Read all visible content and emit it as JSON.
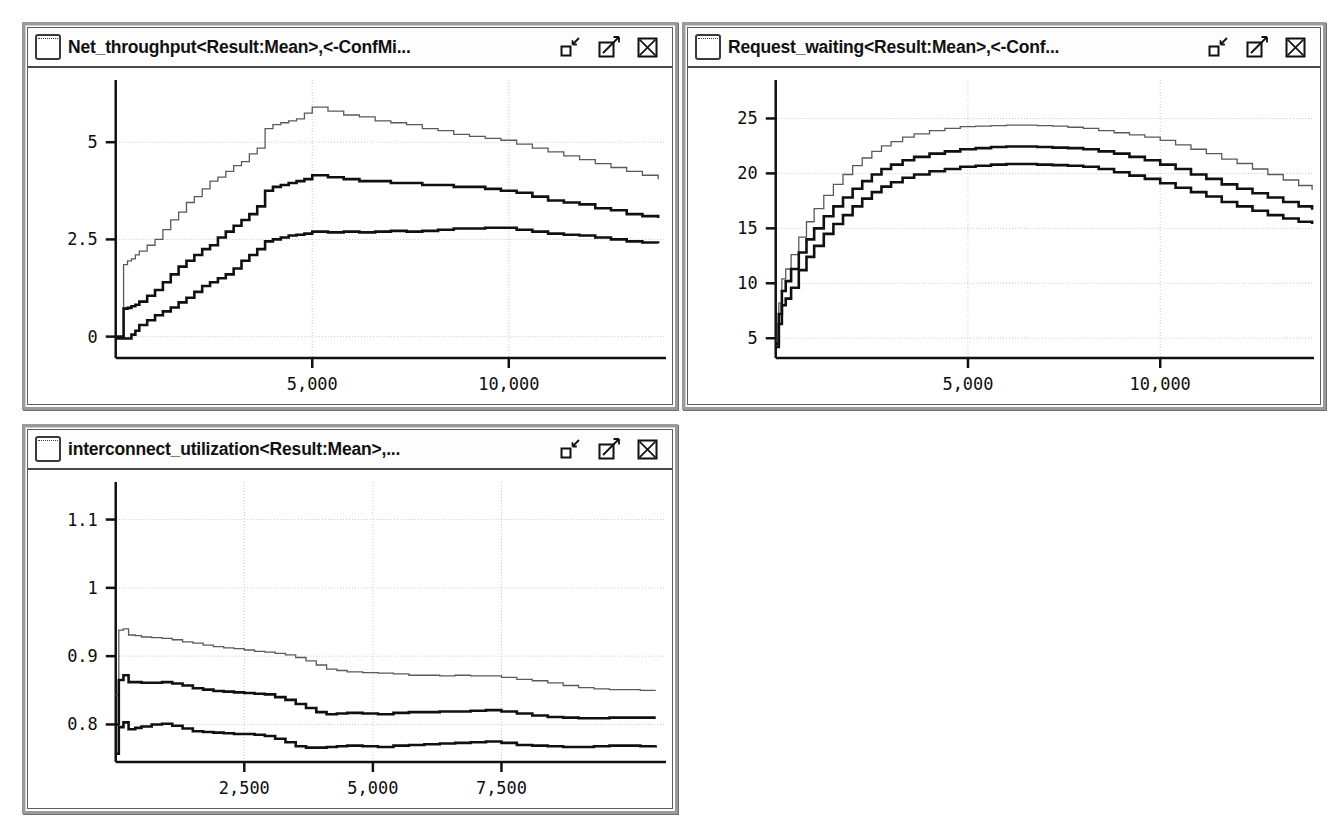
{
  "desktop": {
    "background": "#ffffff"
  },
  "icons": {
    "window": "window-icon",
    "minimize": "minimize-icon",
    "maximize": "maximize-icon",
    "close": "close-icon"
  },
  "windows": [
    {
      "id": "net-throughput",
      "title": "Net_throughput<Result:Mean>,<-ConfMi...",
      "rect": {
        "x": 22,
        "y": 22,
        "w": 656,
        "h": 388
      }
    },
    {
      "id": "request-waiting",
      "title": "Request_waiting<Result:Mean>,<-Conf...",
      "rect": {
        "x": 682,
        "y": 22,
        "w": 644,
        "h": 388
      }
    },
    {
      "id": "interconnect-utilization",
      "title": "interconnect_utilization<Result:Mean>,...",
      "rect": {
        "x": 22,
        "y": 424,
        "w": 656,
        "h": 390
      }
    }
  ],
  "chart_data": [
    {
      "id": "net-throughput",
      "type": "line",
      "title": "Net_throughput<Result:Mean>,<-ConfMi...",
      "xlabel": "",
      "ylabel": "",
      "grid": true,
      "legend": "none",
      "xlim": [
        0,
        14000
      ],
      "ylim": [
        -0.55,
        6.6
      ],
      "xticks": [
        5000,
        10000
      ],
      "xticklabels": [
        "5,000",
        "10,000"
      ],
      "yticks": [
        0,
        2.5,
        5
      ],
      "yticklabels": [
        "0",
        "2.5",
        "5"
      ],
      "x": [
        0,
        150,
        200,
        300,
        400,
        500,
        600,
        800,
        1000,
        1200,
        1400,
        1600,
        1800,
        2000,
        2200,
        2400,
        2600,
        2800,
        3000,
        3200,
        3400,
        3600,
        3800,
        4000,
        4200,
        4400,
        4600,
        4800,
        5000,
        5400,
        5800,
        6200,
        6600,
        7000,
        7400,
        7800,
        8200,
        8600,
        9000,
        9400,
        9800,
        10200,
        10600,
        11000,
        11400,
        11800,
        12200,
        12600,
        13000,
        13400,
        13800
      ],
      "series": [
        {
          "name": "ConfMax",
          "style": "thin-gray",
          "values": [
            0.0,
            0.0,
            1.85,
            1.95,
            2.0,
            2.1,
            2.2,
            2.35,
            2.5,
            2.75,
            3.0,
            3.2,
            3.45,
            3.6,
            3.8,
            4.0,
            4.1,
            4.25,
            4.4,
            4.5,
            4.7,
            4.85,
            5.35,
            5.45,
            5.5,
            5.55,
            5.6,
            5.75,
            5.9,
            5.8,
            5.7,
            5.65,
            5.55,
            5.5,
            5.45,
            5.35,
            5.3,
            5.2,
            5.15,
            5.1,
            5.05,
            4.95,
            4.85,
            4.75,
            4.65,
            4.55,
            4.45,
            4.35,
            4.25,
            4.15,
            4.05
          ]
        },
        {
          "name": "Mean",
          "style": "thick-black",
          "values": [
            0.0,
            0.0,
            0.72,
            0.74,
            0.78,
            0.82,
            0.9,
            1.05,
            1.2,
            1.4,
            1.6,
            1.8,
            1.95,
            2.1,
            2.25,
            2.35,
            2.55,
            2.7,
            2.85,
            3.0,
            3.15,
            3.35,
            3.75,
            3.85,
            3.9,
            3.95,
            4.0,
            4.05,
            4.15,
            4.1,
            4.05,
            4.0,
            4.0,
            3.95,
            3.95,
            3.9,
            3.9,
            3.85,
            3.85,
            3.8,
            3.75,
            3.7,
            3.6,
            3.5,
            3.45,
            3.4,
            3.3,
            3.25,
            3.15,
            3.1,
            3.05
          ]
        },
        {
          "name": "ConfMin",
          "style": "thick-black",
          "values": [
            -0.05,
            -0.05,
            -0.05,
            -0.05,
            0.05,
            0.15,
            0.3,
            0.42,
            0.55,
            0.65,
            0.75,
            0.88,
            1.0,
            1.15,
            1.3,
            1.4,
            1.5,
            1.6,
            1.75,
            1.95,
            2.1,
            2.25,
            2.45,
            2.5,
            2.55,
            2.6,
            2.62,
            2.65,
            2.7,
            2.68,
            2.7,
            2.68,
            2.7,
            2.72,
            2.7,
            2.72,
            2.75,
            2.78,
            2.78,
            2.8,
            2.8,
            2.75,
            2.7,
            2.65,
            2.62,
            2.6,
            2.55,
            2.5,
            2.45,
            2.42,
            2.4
          ]
        }
      ]
    },
    {
      "id": "request-waiting",
      "type": "line",
      "title": "Request_waiting<Result:Mean>,<-Conf...",
      "xlabel": "",
      "ylabel": "",
      "grid": true,
      "legend": "none",
      "xlim": [
        0,
        14000
      ],
      "ylim": [
        3.2,
        28.5
      ],
      "xticks": [
        5000,
        10000
      ],
      "xticklabels": [
        "5,000",
        "10,000"
      ],
      "yticks": [
        5,
        10,
        15,
        20,
        25
      ],
      "yticklabels": [
        "5",
        "10",
        "15",
        "20",
        "25"
      ],
      "x": [
        0,
        80,
        160,
        260,
        400,
        600,
        800,
        1000,
        1250,
        1500,
        1750,
        2000,
        2250,
        2500,
        2750,
        3000,
        3300,
        3600,
        4000,
        4400,
        4800,
        5200,
        5600,
        6000,
        6400,
        6800,
        7200,
        7600,
        8000,
        8400,
        8800,
        9200,
        9600,
        10000,
        10400,
        10800,
        11200,
        11600,
        12000,
        12400,
        12800,
        13200,
        13600,
        13950
      ],
      "series": [
        {
          "name": "ConfMax",
          "style": "thin-gray",
          "values": [
            4.8,
            8.2,
            10.4,
            11.3,
            12.6,
            14.2,
            15.6,
            16.8,
            18.0,
            19.0,
            19.9,
            20.7,
            21.4,
            22.0,
            22.5,
            22.9,
            23.3,
            23.6,
            23.9,
            24.1,
            24.25,
            24.3,
            24.35,
            24.4,
            24.4,
            24.35,
            24.3,
            24.2,
            24.1,
            23.9,
            23.7,
            23.5,
            23.3,
            23.0,
            22.6,
            22.2,
            21.8,
            21.3,
            20.9,
            20.4,
            19.9,
            19.4,
            18.9,
            18.5
          ]
        },
        {
          "name": "Mean",
          "style": "thick-black",
          "values": [
            4.5,
            7.2,
            9.3,
            10.2,
            11.3,
            12.8,
            14.0,
            15.0,
            16.1,
            17.0,
            17.8,
            18.6,
            19.3,
            19.9,
            20.4,
            20.8,
            21.2,
            21.5,
            21.8,
            22.0,
            22.2,
            22.3,
            22.4,
            22.45,
            22.45,
            22.4,
            22.35,
            22.3,
            22.2,
            22.0,
            21.8,
            21.5,
            21.2,
            20.8,
            20.4,
            19.9,
            19.5,
            19.0,
            18.6,
            18.2,
            17.8,
            17.4,
            17.0,
            16.7
          ]
        },
        {
          "name": "ConfMin",
          "style": "thick-black",
          "values": [
            4.2,
            6.3,
            8.0,
            8.6,
            9.6,
            11.2,
            12.4,
            13.4,
            14.5,
            15.4,
            16.2,
            17.0,
            17.7,
            18.3,
            18.8,
            19.2,
            19.6,
            19.9,
            20.2,
            20.4,
            20.6,
            20.7,
            20.8,
            20.85,
            20.85,
            20.8,
            20.75,
            20.7,
            20.6,
            20.4,
            20.1,
            19.8,
            19.5,
            19.1,
            18.7,
            18.3,
            17.9,
            17.4,
            17.0,
            16.6,
            16.2,
            15.9,
            15.6,
            15.4
          ]
        }
      ]
    },
    {
      "id": "interconnect-utilization",
      "type": "line",
      "title": "interconnect_utilization<Result:Mean>,...",
      "xlabel": "",
      "ylabel": "",
      "grid": true,
      "legend": "none",
      "xlim": [
        0,
        10700
      ],
      "ylim": [
        0.745,
        1.155
      ],
      "xticks": [
        2500,
        5000,
        7500
      ],
      "xticklabels": [
        "2,500",
        "5,000",
        "7,500"
      ],
      "yticks": [
        0.8,
        0.9,
        1,
        1.1
      ],
      "yticklabels": [
        "0.8",
        "0.9",
        "1",
        "1.1"
      ],
      "x": [
        0,
        60,
        150,
        250,
        380,
        500,
        700,
        900,
        1100,
        1300,
        1500,
        1700,
        1900,
        2100,
        2300,
        2500,
        2700,
        2900,
        3100,
        3300,
        3500,
        3700,
        3900,
        4100,
        4300,
        4500,
        4800,
        5100,
        5400,
        5700,
        6000,
        6300,
        6600,
        6900,
        7200,
        7500,
        7800,
        8100,
        8400,
        8700,
        9000,
        9300,
        9600,
        9900,
        10200,
        10500
      ],
      "series": [
        {
          "name": "ConfMax",
          "style": "thin-gray",
          "values": [
            0.843,
            0.938,
            0.94,
            0.931,
            0.93,
            0.928,
            0.927,
            0.926,
            0.924,
            0.921,
            0.919,
            0.916,
            0.914,
            0.912,
            0.911,
            0.909,
            0.907,
            0.906,
            0.904,
            0.902,
            0.898,
            0.893,
            0.887,
            0.881,
            0.879,
            0.877,
            0.876,
            0.875,
            0.874,
            0.872,
            0.872,
            0.871,
            0.872,
            0.871,
            0.871,
            0.869,
            0.866,
            0.864,
            0.861,
            0.857,
            0.854,
            0.852,
            0.851,
            0.851,
            0.85,
            0.85
          ]
        },
        {
          "name": "Mean",
          "style": "thick-black",
          "values": [
            0.8,
            0.865,
            0.872,
            0.862,
            0.862,
            0.861,
            0.861,
            0.862,
            0.86,
            0.857,
            0.853,
            0.851,
            0.849,
            0.848,
            0.847,
            0.846,
            0.845,
            0.844,
            0.84,
            0.836,
            0.83,
            0.824,
            0.818,
            0.815,
            0.816,
            0.817,
            0.816,
            0.815,
            0.817,
            0.818,
            0.818,
            0.819,
            0.819,
            0.82,
            0.821,
            0.819,
            0.816,
            0.813,
            0.811,
            0.81,
            0.809,
            0.809,
            0.81,
            0.81,
            0.81,
            0.81
          ]
        },
        {
          "name": "ConfMin",
          "style": "thick-black",
          "values": [
            0.757,
            0.796,
            0.803,
            0.793,
            0.795,
            0.797,
            0.8,
            0.801,
            0.798,
            0.794,
            0.79,
            0.789,
            0.788,
            0.787,
            0.786,
            0.786,
            0.785,
            0.783,
            0.779,
            0.774,
            0.768,
            0.766,
            0.766,
            0.767,
            0.768,
            0.769,
            0.768,
            0.767,
            0.769,
            0.77,
            0.771,
            0.772,
            0.773,
            0.774,
            0.775,
            0.773,
            0.77,
            0.769,
            0.768,
            0.767,
            0.767,
            0.768,
            0.769,
            0.769,
            0.768,
            0.769
          ]
        }
      ]
    }
  ]
}
